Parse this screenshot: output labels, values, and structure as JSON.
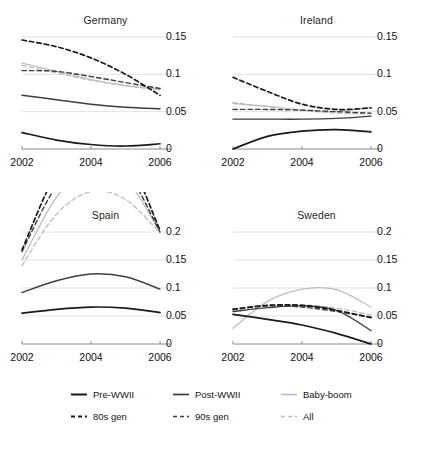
{
  "chart_data": {
    "type": "line",
    "title": "",
    "xlabel": "",
    "ylabel": "",
    "x": [
      2002,
      2003,
      2004,
      2005,
      2006
    ],
    "xticks": [
      "2002",
      "2004",
      "2006"
    ],
    "xlim": [
      2002,
      2006
    ],
    "grid": true,
    "legend_position": "bottom",
    "series_styles": [
      {
        "name": "Pre-WWII",
        "dash": "solid",
        "color": "#1a1a1a",
        "width": 1.7
      },
      {
        "name": "Post-WWII",
        "dash": "solid",
        "color": "#3d3d3d",
        "width": 1.4
      },
      {
        "name": "Baby-boom",
        "dash": "solid",
        "color": "#bdbdbd",
        "width": 1.3
      },
      {
        "name": "80s gen",
        "dash": "dashed",
        "color": "#1a1a1a",
        "width": 1.7
      },
      {
        "name": "90s gen",
        "dash": "dashed",
        "color": "#3d3d3d",
        "width": 1.4
      },
      {
        "name": "All",
        "dash": "dashed",
        "color": "#bdbdbd",
        "width": 1.3
      }
    ],
    "panels": [
      {
        "title": "Germany",
        "ylim": [
          0,
          0.15
        ],
        "yticks": [
          0,
          0.05,
          0.1,
          0.15
        ],
        "yticklabels": [
          "0",
          "0.05",
          "0.1",
          "0.15"
        ],
        "series": [
          {
            "name": "Pre-WWII",
            "values": [
              0.022,
              0.012,
              0.006,
              0.004,
              0.007
            ]
          },
          {
            "name": "Post-WWII",
            "values": [
              0.072,
              0.066,
              0.06,
              0.056,
              0.054
            ]
          },
          {
            "name": "Baby-boom",
            "values": [
              0.115,
              0.104,
              0.093,
              0.085,
              0.08
            ]
          },
          {
            "name": "80s gen",
            "values": [
              0.146,
              0.137,
              0.122,
              0.1,
              0.072
            ]
          },
          {
            "name": "90s gen",
            "values": [
              0.105,
              0.104,
              0.097,
              0.089,
              0.081
            ]
          },
          {
            "name": "All",
            "values": [
              0.112,
              0.102,
              0.092,
              0.085,
              0.079
            ]
          }
        ]
      },
      {
        "title": "Ireland",
        "ylim": [
          0,
          0.15
        ],
        "yticks": [
          0,
          0.05,
          0.1,
          0.15
        ],
        "yticklabels": [
          "0",
          "0.05",
          "0.1",
          "0.15"
        ],
        "series": [
          {
            "name": "Pre-WWII",
            "values": [
              0.0,
              0.017,
              0.024,
              0.026,
              0.023
            ]
          },
          {
            "name": "Post-WWII",
            "values": [
              0.04,
              0.04,
              0.04,
              0.041,
              0.044
            ]
          },
          {
            "name": "Baby-boom",
            "values": [
              0.061,
              0.057,
              0.052,
              0.05,
              0.056
            ]
          },
          {
            "name": "80s gen",
            "values": [
              0.096,
              0.077,
              0.06,
              0.053,
              0.055
            ]
          },
          {
            "name": "90s gen",
            "values": [
              0.053,
              0.053,
              0.052,
              0.05,
              0.048
            ]
          },
          {
            "name": "All",
            "values": [
              0.062,
              0.057,
              0.052,
              0.048,
              0.047
            ]
          }
        ]
      },
      {
        "title": "Spain",
        "ylim": [
          0,
          0.2
        ],
        "yticks": [
          0,
          0.05,
          0.1,
          0.15,
          0.2
        ],
        "yticklabels": [
          "0",
          "0.05",
          "0.1",
          "0.15",
          "0.2"
        ],
        "series": [
          {
            "name": "Pre-WWII",
            "values": [
              0.055,
              0.062,
              0.066,
              0.064,
              0.056
            ]
          },
          {
            "name": "Post-WWII",
            "values": [
              0.092,
              0.113,
              0.125,
              0.12,
              0.098
            ]
          },
          {
            "name": "Baby-boom",
            "values": [
              0.15,
              0.262,
              0.312,
              0.295,
              0.2
            ]
          },
          {
            "name": "80s gen",
            "values": [
              0.168,
              0.305,
              0.36,
              0.338,
              0.203
            ]
          },
          {
            "name": "90s gen",
            "values": [
              0.165,
              0.282,
              0.33,
              0.31,
              0.2
            ]
          },
          {
            "name": "All",
            "values": [
              0.14,
              0.232,
              0.272,
              0.258,
              0.198
            ]
          }
        ]
      },
      {
        "title": "Sweden",
        "ylim": [
          0,
          0.2
        ],
        "yticks": [
          0,
          0.05,
          0.1,
          0.15,
          0.2
        ],
        "yticklabels": [
          "0",
          "0.05",
          "0.1",
          "0.15",
          "0.2"
        ],
        "series": [
          {
            "name": "Pre-WWII",
            "values": [
              0.053,
              0.044,
              0.034,
              0.019,
              0.0
            ]
          },
          {
            "name": "Post-WWII",
            "values": [
              0.058,
              0.065,
              0.068,
              0.06,
              0.024
            ]
          },
          {
            "name": "Baby-boom",
            "values": [
              0.028,
              0.076,
              0.098,
              0.097,
              0.066
            ]
          },
          {
            "name": "80s gen",
            "values": [
              0.062,
              0.069,
              0.069,
              0.06,
              0.047
            ]
          },
          {
            "name": "90s gen",
            "values": [
              0.062,
              0.068,
              0.066,
              0.058,
              0.048
            ]
          },
          {
            "name": "All",
            "values": [
              0.06,
              0.069,
              0.07,
              0.064,
              0.052
            ]
          }
        ]
      }
    ],
    "legend": [
      {
        "label": "Pre-WWII"
      },
      {
        "label": "Post-WWII"
      },
      {
        "label": "Baby-boom"
      },
      {
        "label": "80s gen"
      },
      {
        "label": "90s gen"
      },
      {
        "label": "All"
      }
    ]
  },
  "caption": ""
}
